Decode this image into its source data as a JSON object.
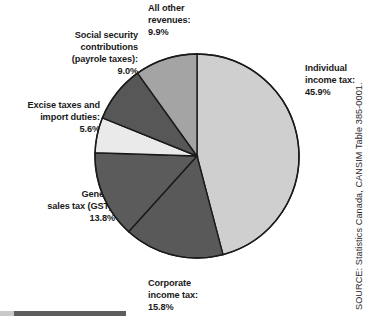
{
  "chart_data": {
    "type": "pie",
    "title": "",
    "subtitle": "",
    "xlabel": "",
    "ylabel": "",
    "grid": false,
    "legend_position": "outside-callout-labels",
    "units": "percent",
    "start_angle_deg": 0,
    "direction": "clockwise",
    "categories": [
      "Individual income tax",
      "Corporate income tax",
      "General sales tax (GST)",
      "Excise taxes and import duties",
      "Social security contributions (payrole taxes)",
      "All other revenues"
    ],
    "values": [
      45.9,
      15.8,
      13.8,
      5.6,
      9.0,
      9.9
    ],
    "value_labels": [
      "45.9%",
      "15.8%",
      "13.8%",
      "5.6%",
      "9.0%",
      "9.9%"
    ],
    "colors": [
      "#cfcfcf",
      "#595959",
      "#5b5b5b",
      "#eaeaea",
      "#575757",
      "#a4a4a4"
    ],
    "slices": [
      {
        "name": "Individual income tax",
        "value": 45.9,
        "value_label": "45.9%",
        "color": "#cfcfcf",
        "label_line_1": "Individual",
        "label_line_2": "income tax:"
      },
      {
        "name": "Corporate income tax",
        "value": 15.8,
        "value_label": "15.8%",
        "color": "#595959",
        "label_line_1": "Corporate",
        "label_line_2": "income tax:"
      },
      {
        "name": "General sales tax (GST)",
        "value": 13.8,
        "value_label": "13.8%",
        "color": "#5b5b5b",
        "label_line_1": "General",
        "label_line_2": "sales tax (GST):"
      },
      {
        "name": "Excise taxes and import duties",
        "value": 5.6,
        "value_label": "5.6%",
        "color": "#eaeaea",
        "label_line_1": "Excise taxes and",
        "label_line_2": "import duties:"
      },
      {
        "name": "Social security contributions (payrole taxes)",
        "value": 9.0,
        "value_label": "9.0%",
        "color": "#575757",
        "label_line_1": "Social security",
        "label_line_2": "contributions",
        "label_line_3": "(payrole taxes):"
      },
      {
        "name": "All other revenues",
        "value": 9.9,
        "value_label": "9.9%",
        "color": "#a4a4a4",
        "label_line_1": "All other",
        "label_line_2": "revenues:"
      }
    ]
  },
  "labels": {
    "individual_income_tax": "Individual\nincome tax:\n45.9%",
    "corporate_income_tax": "Corporate\nincome tax:\n15.8%",
    "general_sales_tax": "General\nsales tax (GST):\n13.8%",
    "excise_taxes": "Excise taxes and\nimport duties:\n5.6%",
    "social_security": "Social security\ncontributions\n(payrole taxes):\n9.0%",
    "all_other_revenues": "All other\nrevenues:\n9.9%"
  },
  "source": {
    "credit": "SOURCE: Statistics Canada, CANSIM Table 385-0001."
  },
  "style": {
    "slice_outline": "#1a1a1a",
    "text_color": "#1a1a1a",
    "background": "#ffffff"
  }
}
